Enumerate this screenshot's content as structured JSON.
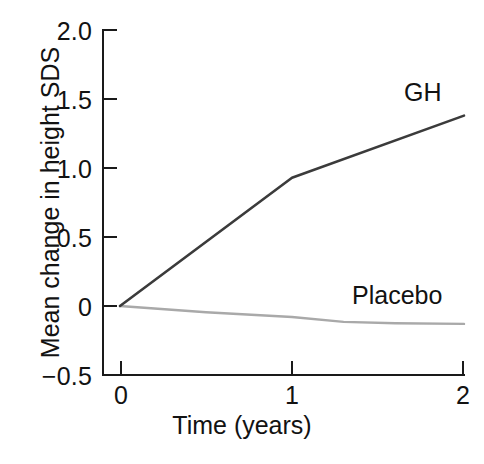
{
  "chart_data": {
    "type": "line",
    "title": "",
    "xlabel": "Time (years)",
    "ylabel": "Mean change in height SDS",
    "xlim": [
      0,
      2
    ],
    "ylim": [
      -0.5,
      2.0
    ],
    "xticks": [
      0,
      1,
      2
    ],
    "xtick_labels": [
      "0",
      "1",
      "2"
    ],
    "yticks": [
      -0.5,
      0,
      0.5,
      1.0,
      1.5,
      2.0
    ],
    "ytick_labels": [
      "−0.5",
      "0",
      "0.5",
      "1.0",
      "1.5",
      "2.0"
    ],
    "grid": false,
    "legend": "inline-series-labels",
    "x": [
      0,
      1,
      2
    ],
    "series": [
      {
        "name": "GH",
        "label": "GH",
        "color": "#3b3b3b",
        "values": [
          0,
          0.93,
          1.38
        ],
        "points": [
          {
            "x": 0,
            "y": 0
          },
          {
            "x": 1,
            "y": 0.93
          },
          {
            "x": 2,
            "y": 1.38
          }
        ]
      },
      {
        "name": "Placebo",
        "label": "Placebo",
        "color": "#a9a9a9",
        "values": [
          0,
          -0.08,
          -0.13
        ],
        "points": [
          {
            "x": 0,
            "y": 0
          },
          {
            "x": 0.5,
            "y": -0.045
          },
          {
            "x": 1,
            "y": -0.08
          },
          {
            "x": 1.3,
            "y": -0.115
          },
          {
            "x": 1.6,
            "y": -0.125
          },
          {
            "x": 2,
            "y": -0.13
          }
        ]
      }
    ]
  },
  "axes": {
    "y_title": "Mean change in height SDS",
    "x_title": "Time (years)",
    "y_tick_0": "2.0",
    "y_tick_1": "1.5",
    "y_tick_2": "1.0",
    "y_tick_3": "0.5",
    "y_tick_4": "0",
    "y_tick_5": "−0.5",
    "x_tick_0": "0",
    "x_tick_1": "1",
    "x_tick_2": "2"
  },
  "labels": {
    "gh": "GH",
    "placebo": "Placebo"
  },
  "colors": {
    "gh_line": "#3b3b3b",
    "placebo_line": "#a9a9a9",
    "axis": "#1a1a1a",
    "text": "#121212",
    "background": "#ffffff"
  }
}
